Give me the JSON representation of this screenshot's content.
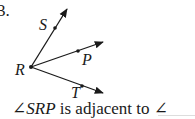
{
  "problem": {
    "number": "3.",
    "labels": {
      "S": "S",
      "P": "P",
      "R": "R",
      "T": "T"
    },
    "caption": {
      "angle_symbol": "∠",
      "angle_name": "SRP",
      "text": " is adjacent to ∠"
    }
  },
  "diagram": {
    "vertex": "R",
    "rays": [
      {
        "name": "RS",
        "point": "S"
      },
      {
        "name": "RP",
        "point": "P"
      },
      {
        "name": "RT",
        "point": "T"
      }
    ],
    "stroke_color": "#1a1a1a"
  }
}
